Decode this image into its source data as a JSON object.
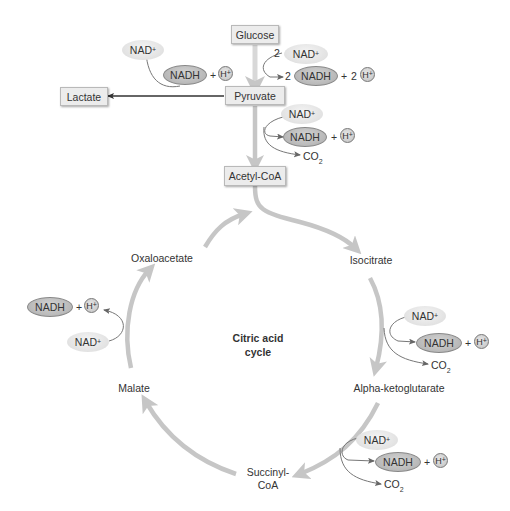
{
  "diagram": {
    "title_line1": "Citric acid",
    "title_line2": "cycle",
    "nodes": {
      "glucose": "Glucose",
      "pyruvate": "Pyruvate",
      "lactate": "Lactate",
      "acetyl_coa": "Acetyl-CoA",
      "isocitrate": "Isocitrate",
      "alpha_ketoglutarate": "Alpha-ketoglutarate",
      "succinyl_coa_line1": "Succinyl-",
      "succinyl_coa_line2": "CoA",
      "malate": "Malate",
      "oxaloacetate": "Oxaloacetate"
    },
    "molecules": {
      "nad": "NAD",
      "nad_charge": "+",
      "nadh": "NADH",
      "h": "H",
      "h_charge": "+",
      "plus": "+",
      "co2": "CO",
      "co2_sub": "2",
      "coefficient_2": "2"
    },
    "colors": {
      "pathway_arrow": "#c6c6c6",
      "thin_arrow": "#777777",
      "box_fill": "#ececec",
      "nad_fill": "#e4e4e4",
      "nadh_fill": "#b9b9b9"
    }
  }
}
